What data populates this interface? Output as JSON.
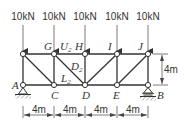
{
  "diagram": {
    "type": "truss",
    "loads": [
      {
        "node": "top-left",
        "label": "10kN"
      },
      {
        "node": "G",
        "label": "10kN"
      },
      {
        "node": "H",
        "label": "10kN"
      },
      {
        "node": "I",
        "label": "10kN"
      },
      {
        "node": "J",
        "label": "10kN"
      }
    ],
    "node_labels": {
      "G": "G",
      "H": "H",
      "I": "I",
      "J": "J",
      "A": "A",
      "C": "C",
      "D": "D",
      "E": "E",
      "B": "B"
    },
    "member_labels": [
      {
        "base": "U",
        "sub": "2"
      },
      {
        "base": "D",
        "sub": "2"
      },
      {
        "base": "L",
        "sub": "2"
      }
    ],
    "height_dimension": "4m",
    "span_dimensions": [
      "4m",
      "4m",
      "4m",
      "4m"
    ],
    "supports": {
      "A": "pin",
      "B": "roller"
    }
  }
}
